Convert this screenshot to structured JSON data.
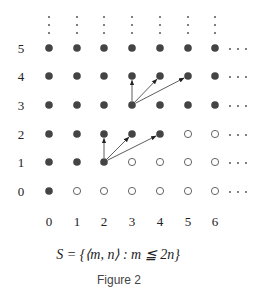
{
  "figure": {
    "caption": "Figure 2",
    "formula": "S = {⟨m, n⟩ : m ≦ 2n}",
    "x_labels": [
      "0",
      "1",
      "2",
      "3",
      "4",
      "5",
      "6"
    ],
    "y_labels": [
      "0",
      "1",
      "2",
      "3",
      "4",
      "5"
    ],
    "columns_x": [
      49,
      77,
      104,
      132,
      160,
      188,
      215
    ],
    "rows_y": [
      191,
      162,
      134,
      105,
      76,
      48
    ],
    "point_rule": "filled if m <= 2n, hollow otherwise",
    "hollow_points": [
      [
        1,
        0
      ],
      [
        2,
        0
      ],
      [
        3,
        0
      ],
      [
        4,
        0
      ],
      [
        5,
        0
      ],
      [
        6,
        0
      ],
      [
        3,
        1
      ],
      [
        4,
        1
      ],
      [
        5,
        1
      ],
      [
        6,
        1
      ],
      [
        5,
        2
      ],
      [
        6,
        2
      ]
    ],
    "arrows": [
      {
        "from": [
          2,
          1
        ],
        "to": [
          2,
          2
        ]
      },
      {
        "from": [
          2,
          1
        ],
        "to": [
          3,
          2
        ]
      },
      {
        "from": [
          2,
          1
        ],
        "to": [
          4,
          2
        ]
      },
      {
        "from": [
          3,
          3
        ],
        "to": [
          3,
          4
        ]
      },
      {
        "from": [
          3,
          3
        ],
        "to": [
          4,
          4
        ]
      },
      {
        "from": [
          3,
          3
        ],
        "to": [
          5,
          4
        ]
      }
    ],
    "colors": {
      "filled": "#444444",
      "hollow_stroke": "#555555",
      "arrow": "#333333",
      "text": "#222222"
    }
  }
}
